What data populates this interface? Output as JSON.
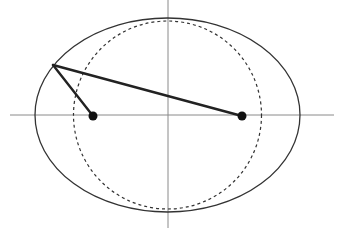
{
  "diagram": {
    "axes": {
      "color": "#8a8a8a",
      "horizontal": {
        "x1": 10,
        "y1": 115,
        "x2": 334,
        "y2": 115
      },
      "vertical": {
        "x1": 168,
        "y1": 0,
        "x2": 168,
        "y2": 228
      }
    },
    "ellipse": {
      "cx": 167.5,
      "cy": 115,
      "rx": 132.5,
      "ry": 97,
      "color": "#333333"
    },
    "auxiliary_circle": {
      "cx": 167.5,
      "cy": 115,
      "r": 94,
      "color": "#333333",
      "dash": "3,3"
    },
    "foci": [
      {
        "name": "left-focus",
        "cx": 93,
        "cy": 116,
        "r": 4.5
      },
      {
        "name": "right-focus",
        "cx": 242,
        "cy": 116,
        "r": 4.5
      }
    ],
    "point_on_ellipse": {
      "x": 53,
      "y": 65
    },
    "focal_radii": {
      "color": "#222222",
      "width": 2.4
    }
  }
}
